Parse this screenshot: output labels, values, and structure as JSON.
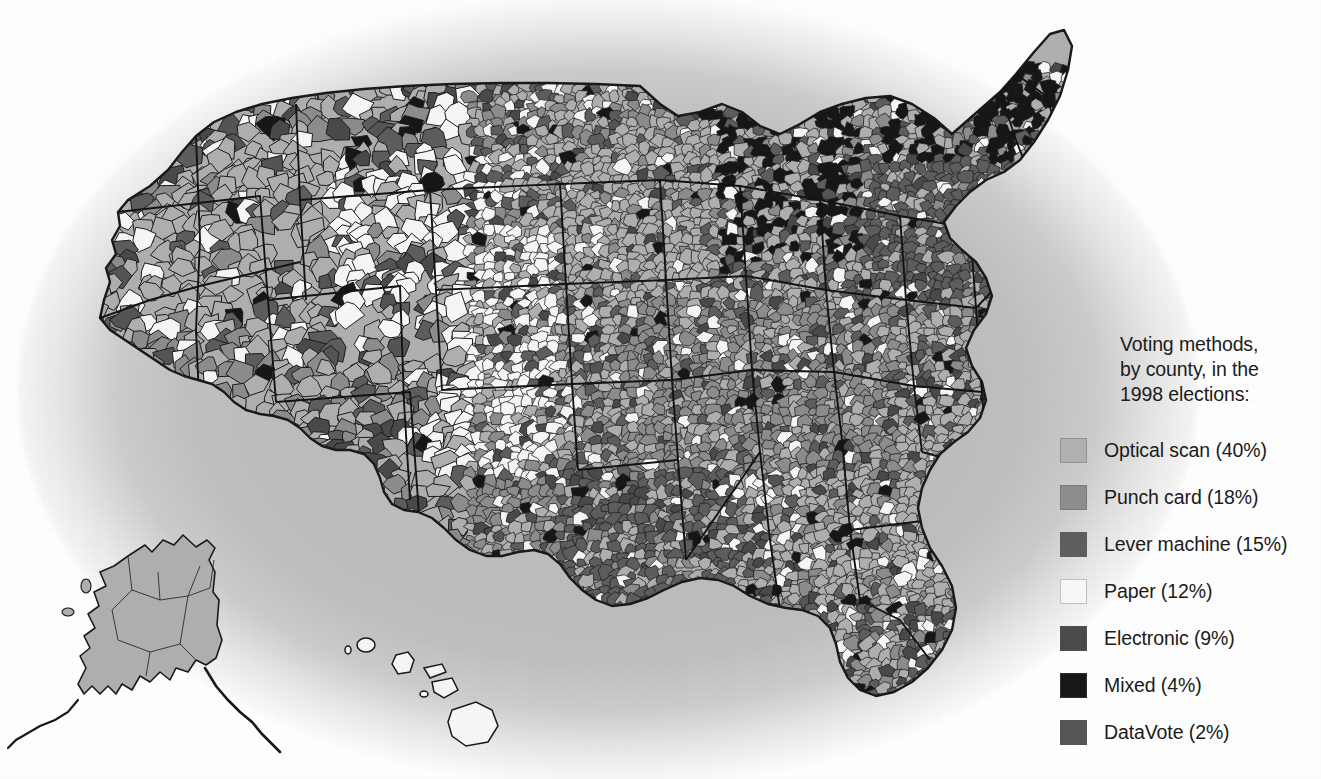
{
  "figure": {
    "kind": "choropleth-map",
    "region": "United States",
    "unit": "county",
    "background_oval_color": "#bdbdbd",
    "page_background": "#ffffff",
    "border_color": "#1a1a1a"
  },
  "legend": {
    "title": "Voting methods,\nby county, in the\n1998 elections:",
    "title_lines": [
      "Voting methods,",
      "by county, in the",
      "1998 elections:"
    ],
    "items": [
      {
        "label": "Optical scan (40%)",
        "method": "Optical scan",
        "percent": 40,
        "color": "#b0b0b0",
        "swatch_name": "optical-scan"
      },
      {
        "label": "Punch card (18%)",
        "method": "Punch card",
        "percent": 18,
        "color": "#8d8d8d",
        "swatch_name": "punch-card"
      },
      {
        "label": "Lever machine (15%)",
        "method": "Lever machine",
        "percent": 15,
        "color": "#5e5e5e",
        "swatch_name": "lever-machine"
      },
      {
        "label": "Paper (12%)",
        "method": "Paper",
        "percent": 12,
        "color": "#f7f7f7",
        "swatch_name": "paper"
      },
      {
        "label": "Electronic (9%)",
        "method": "Electronic",
        "percent": 9,
        "color": "#4a4a4a",
        "swatch_name": "electronic"
      },
      {
        "label": "Mixed (4%)",
        "method": "Mixed",
        "percent": 4,
        "color": "#17171a",
        "swatch_name": "mixed"
      },
      {
        "label": "DataVote (2%)",
        "method": "DataVote",
        "percent": 2,
        "color": "#555555",
        "swatch_name": "datavote"
      }
    ]
  },
  "chart_data": {
    "type": "map",
    "subtype": "choropleth",
    "title": "Voting methods, by county, in the 1998 elections:",
    "categories": [
      "Optical scan",
      "Punch card",
      "Lever machine",
      "Paper",
      "Electronic",
      "Mixed",
      "DataVote"
    ],
    "values": [
      40,
      18,
      15,
      12,
      9,
      4,
      2
    ],
    "value_unit": "percent of counties",
    "colors": [
      "#b0b0b0",
      "#8d8d8d",
      "#5e5e5e",
      "#f7f7f7",
      "#4a4a4a",
      "#17171a",
      "#555555"
    ],
    "legend_position": "right",
    "grid": false,
    "insets": [
      "Alaska",
      "Hawaii"
    ],
    "region_notes": [
      {
        "region": "Alaska",
        "dominant_method": "Optical scan"
      },
      {
        "region": "Hawaii",
        "dominant_method": "Paper"
      },
      {
        "region": "Maine",
        "dominant_method": "Mixed"
      },
      {
        "region": "New York",
        "dominant_method": "Lever machine"
      },
      {
        "region": "Pennsylvania",
        "dominant_method": "Lever machine"
      },
      {
        "region": "Michigan",
        "dominant_method": "Mixed"
      },
      {
        "region": "Wisconsin",
        "dominant_method": "Mixed"
      },
      {
        "region": "Louisiana",
        "dominant_method": "Lever machine"
      },
      {
        "region": "Tennessee",
        "dominant_method": "Punch card"
      },
      {
        "region": "Kansas",
        "dominant_method": "Paper"
      },
      {
        "region": "Nebraska",
        "dominant_method": "Paper"
      },
      {
        "region": "Texas",
        "dominant_method": "Punch card"
      },
      {
        "region": "California",
        "dominant_method": "Punch card"
      }
    ]
  }
}
